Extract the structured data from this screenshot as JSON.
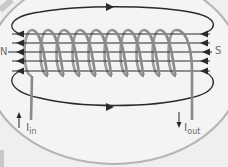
{
  "labels": {
    "north": "N",
    "south": "S",
    "current_in_symbol": "I",
    "current_in_sub": "in",
    "current_out_symbol": "I",
    "current_out_sub": "out"
  },
  "coil": {
    "turns": 10
  },
  "field_lines": {
    "internal_count": 5,
    "external_loops": 2,
    "direction": "right-to-left inside, left-to-right outside"
  },
  "colors": {
    "background": "#efefef",
    "ellipse": "#b5b5b5",
    "coil": "#8a8a8a",
    "field_line": "#2a2a2a",
    "label": "#6a6a6a"
  }
}
